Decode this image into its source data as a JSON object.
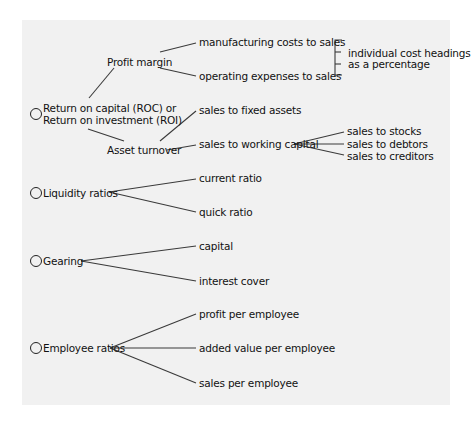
{
  "diagram": {
    "roots": [
      {
        "label_line1": "Return on capital (ROC) or",
        "label_line2": "Return on investment (ROI)",
        "children": [
          {
            "label": "Profit margin",
            "children": [
              {
                "label": "manufacturing costs to sales"
              },
              {
                "label": "operating expenses to sales"
              }
            ],
            "note": {
              "line1": "individual cost headings",
              "line2": "as a percentage"
            }
          },
          {
            "label": "Asset turnover",
            "children": [
              {
                "label": "sales to fixed assets"
              },
              {
                "label": "sales to working capital",
                "children": [
                  {
                    "label": "sales to stocks"
                  },
                  {
                    "label": "sales to debtors"
                  },
                  {
                    "label": "sales to creditors"
                  }
                ]
              }
            ]
          }
        ]
      },
      {
        "label": "Liquidity ratios",
        "children": [
          {
            "label": "current ratio"
          },
          {
            "label": "quick ratio"
          }
        ]
      },
      {
        "label": "Gearing",
        "children": [
          {
            "label": "capital"
          },
          {
            "label": "interest cover"
          }
        ]
      },
      {
        "label": "Employee ratios",
        "children": [
          {
            "label": "profit per employee"
          },
          {
            "label": "added value per employee"
          },
          {
            "label": "sales per employee"
          }
        ]
      }
    ]
  }
}
